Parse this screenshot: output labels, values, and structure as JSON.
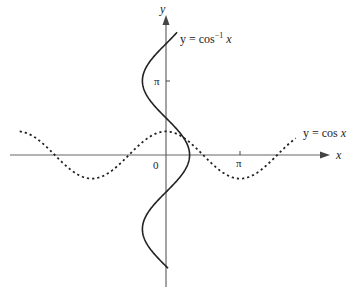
{
  "chart_data": {
    "type": "line",
    "title": "",
    "xlabel": "x",
    "ylabel": "y",
    "series": [
      {
        "name": "y = cos x",
        "style": "dashed",
        "function": "cos(x)",
        "x_range": [
          -6.2,
          5.5
        ],
        "points": [
          [
            -6.2,
            0.997
          ],
          [
            -4.71,
            0
          ],
          [
            -3.14,
            -1
          ],
          [
            -1.57,
            0
          ],
          [
            0,
            1
          ],
          [
            1.57,
            0
          ],
          [
            3.14,
            -1
          ],
          [
            4.71,
            0
          ],
          [
            5.5,
            0.71
          ]
        ]
      },
      {
        "name": "y = cos⁻¹ x",
        "style": "solid",
        "function": "x = cos(y)",
        "y_range": [
          -4.8,
          5.2
        ],
        "points": [
          [
            0.09,
            -4.8
          ],
          [
            0,
            -4.71
          ],
          [
            -1,
            -3.14
          ],
          [
            0,
            -1.57
          ],
          [
            1,
            0
          ],
          [
            0,
            1.57
          ],
          [
            -1,
            3.14
          ],
          [
            0,
            4.71
          ],
          [
            0.47,
            5.2
          ]
        ]
      }
    ],
    "x_ticks": [
      {
        "value": 3.14159,
        "label": "π"
      }
    ],
    "y_ticks": [
      {
        "value": 3.14159,
        "label": "π"
      }
    ],
    "origin_label": "0",
    "grid": false,
    "legend": "inline labels"
  },
  "labels": {
    "x_axis": "x",
    "y_axis": "y",
    "origin": "0",
    "x_pi": "π",
    "y_pi": "π",
    "arccos_prefix": "y = cos",
    "arccos_sup": "−1",
    "arccos_suffix": " x",
    "cos_label": "y = cos x"
  }
}
